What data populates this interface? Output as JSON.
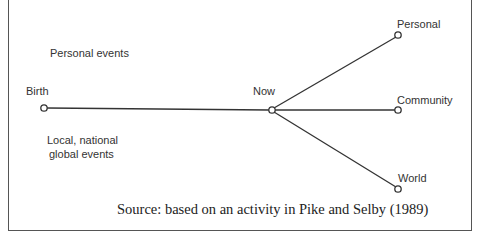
{
  "diagram": {
    "labels": {
      "personal_events": "Personal events",
      "birth": "Birth",
      "now": "Now",
      "personal": "Personal",
      "community": "Community",
      "world": "World",
      "local_line1": "Local, national",
      "local_line2": "global events"
    },
    "source": "Source: based on an activity in Pike and Selby (1989)"
  }
}
